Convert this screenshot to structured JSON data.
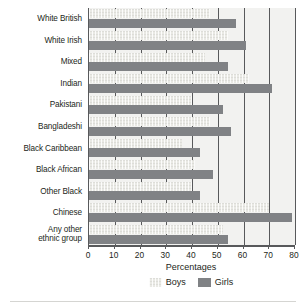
{
  "chart_data": {
    "type": "bar",
    "orientation": "horizontal",
    "title": "",
    "xlabel": "Percentages",
    "ylabel": "",
    "xlim": [
      0,
      80
    ],
    "xticks": [
      0,
      10,
      20,
      30,
      40,
      50,
      60,
      70,
      80
    ],
    "grid": true,
    "grid_axis": "x",
    "legend_position": "bottom",
    "categories": [
      "White British",
      "White Irish",
      "Mixed",
      "Indian",
      "Pakistani",
      "Bangladeshi",
      "Black Caribbean",
      "Black African",
      "Other Black",
      "Chinese",
      "Any other ethnic group"
    ],
    "series": [
      {
        "name": "Boys",
        "color": "#e9e9e4",
        "values": [
          47,
          54,
          45,
          62,
          40,
          47,
          36,
          41,
          40,
          70,
          52
        ]
      },
      {
        "name": "Girls",
        "color": "#808285",
        "values": [
          57,
          61,
          54,
          71,
          52,
          55,
          43,
          48,
          43,
          79,
          54
        ]
      }
    ]
  },
  "legend": {
    "items": [
      {
        "label": "Boys",
        "swatch": "boys"
      },
      {
        "label": "Girls",
        "swatch": "girls"
      }
    ]
  },
  "axis": {
    "x_title": "Percentages"
  },
  "colors": {
    "boys_bar": "#e9e9e4",
    "girls_bar": "#808285",
    "axis_line": "#58595b",
    "plot_background": "#f2f2f0",
    "text": "#231f20"
  }
}
